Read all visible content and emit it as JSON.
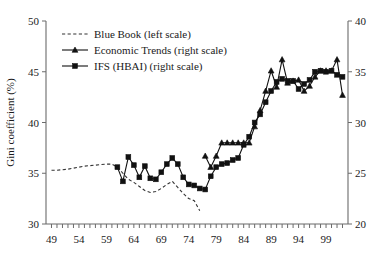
{
  "chart_data": {
    "type": "line",
    "title": "",
    "xlabel": "",
    "ylabel": "Gini coefficient (%)",
    "ylabel_right": "",
    "xlim": [
      1948,
      2003
    ],
    "ylim": [
      30,
      50
    ],
    "ylim_right": [
      20,
      40
    ],
    "grid": false,
    "legend_position": "top-left",
    "x_tick_labels": [
      "49",
      "54",
      "59",
      "64",
      "69",
      "74",
      "79",
      "84",
      "89",
      "94",
      "99"
    ],
    "x_tick_values": [
      1949,
      1954,
      1959,
      1964,
      1969,
      1974,
      1979,
      1984,
      1989,
      1994,
      1999
    ],
    "x_minor_step": 1,
    "y_tick_labels_left": [
      "30",
      "35",
      "40",
      "45",
      "50"
    ],
    "y_tick_values_left": [
      30,
      35,
      40,
      45,
      50
    ],
    "y_tick_labels_right": [
      "20",
      "25",
      "30",
      "35",
      "40"
    ],
    "y_tick_values_right": [
      20,
      25,
      30,
      35,
      40
    ],
    "series": [
      {
        "name": "Blue Book (left scale)",
        "axis": "left",
        "style": "dashed",
        "marker": "none",
        "color": "#333333",
        "x": [
          1949,
          1950,
          1951,
          1952,
          1953,
          1954,
          1955,
          1956,
          1957,
          1958,
          1959,
          1960,
          1961,
          1962,
          1963,
          1964,
          1965,
          1966,
          1967,
          1968,
          1969,
          1970,
          1971,
          1972,
          1973,
          1974,
          1975,
          1976
        ],
        "y": [
          35.3,
          35.3,
          35.35,
          35.4,
          35.5,
          35.6,
          35.7,
          35.75,
          35.8,
          35.85,
          35.9,
          35.9,
          35.6,
          35.0,
          34.4,
          34.1,
          33.7,
          33.3,
          33.1,
          33.2,
          33.5,
          33.9,
          34.2,
          33.6,
          33.0,
          32.5,
          32.3,
          31.3
        ]
      },
      {
        "name": "Economic Trends (right scale)",
        "axis": "right",
        "style": "solid",
        "marker": "triangle",
        "color": "#111111",
        "x": [
          1977,
          1978,
          1979,
          1980,
          1981,
          1982,
          1983,
          1984,
          1985,
          1986,
          1987,
          1988,
          1989,
          1990,
          1991,
          1992,
          1993,
          1994,
          1995,
          1996,
          1997,
          1998,
          1999,
          2000,
          2001,
          2002
        ],
        "y": [
          26.7,
          25.6,
          26.7,
          28.0,
          28.0,
          28.0,
          28.0,
          28.0,
          28.0,
          29.6,
          31.2,
          33.1,
          35.1,
          33.5,
          36.2,
          33.9,
          34.1,
          34.2,
          33.1,
          33.6,
          34.5,
          35.1,
          35.1,
          35.1,
          36.2,
          32.7
        ]
      },
      {
        "name": "IFS (HBAI) (right scale)",
        "axis": "right",
        "style": "solid",
        "marker": "square",
        "color": "#111111",
        "x": [
          1961,
          1962,
          1963,
          1964,
          1965,
          1966,
          1967,
          1968,
          1969,
          1970,
          1971,
          1972,
          1973,
          1974,
          1975,
          1976,
          1977,
          1978,
          1979,
          1980,
          1981,
          1982,
          1983,
          1984,
          1985,
          1986,
          1987,
          1988,
          1989,
          1990,
          1991,
          1992,
          1993,
          1994,
          1995,
          1996,
          1997,
          1998,
          1999,
          2000,
          2001,
          2002
        ],
        "y": [
          25.6,
          24.2,
          26.6,
          25.8,
          24.6,
          25.7,
          24.5,
          24.4,
          25.1,
          25.9,
          26.5,
          25.9,
          24.6,
          23.9,
          23.8,
          23.5,
          23.4,
          24.7,
          25.6,
          25.9,
          26.0,
          26.3,
          26.5,
          27.8,
          28.6,
          30.0,
          30.8,
          32.0,
          33.1,
          34.0,
          34.3,
          34.1,
          34.1,
          33.3,
          33.8,
          34.2,
          35.0,
          35.1,
          35.0,
          35.1,
          34.7,
          34.5
        ]
      }
    ]
  },
  "legend": {
    "items": [
      {
        "label": "Blue Book (left scale)",
        "marker": "dashed-line"
      },
      {
        "label": "Economic Trends (right scale)",
        "marker": "line-triangle"
      },
      {
        "label": "IFS (HBAI) (right scale)",
        "marker": "line-square"
      }
    ]
  },
  "axes": {
    "left_title": "Gini coefficient (%)"
  }
}
